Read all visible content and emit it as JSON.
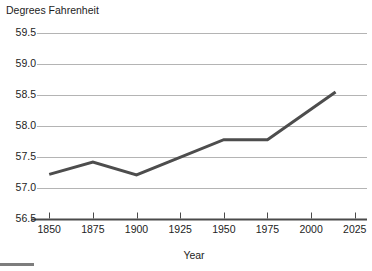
{
  "chart_data": {
    "type": "line",
    "title": "",
    "ylabel": "Degrees Fahrenheit",
    "xlabel": "Year",
    "ylim": [
      56.5,
      59.5
    ],
    "xlim": [
      1843,
      2032
    ],
    "grid": true,
    "legend": null,
    "y_ticks": [
      "59.5",
      "59.0",
      "58.5",
      "58.0",
      "57.5",
      "57.0",
      "56.5"
    ],
    "y_tick_values": [
      59.5,
      59.0,
      58.5,
      58.0,
      57.5,
      57.0,
      56.5
    ],
    "x_ticks": [
      "1850",
      "1875",
      "1900",
      "1925",
      "1950",
      "1975",
      "2000",
      "2025"
    ],
    "x_tick_values": [
      1850,
      1875,
      1900,
      1925,
      1950,
      1975,
      2000,
      2025
    ],
    "series": [
      {
        "name": "Global average temperature",
        "color": "#4d4d4d",
        "x": [
          1850,
          1875,
          1900,
          1950,
          1975,
          2014
        ],
        "values": [
          57.22,
          57.42,
          57.21,
          57.78,
          57.78,
          58.55
        ]
      }
    ]
  },
  "style": {
    "line_color": "#4d4d4d",
    "grid_color": "#b4b4b4",
    "axis_color": "#4a4a4a",
    "text_color": "#1d1d1d",
    "background": "#ffffff",
    "footer_bar_color": "#7d7d7d"
  },
  "footer": {
    "bar_label": "scroll-edge-bar"
  }
}
